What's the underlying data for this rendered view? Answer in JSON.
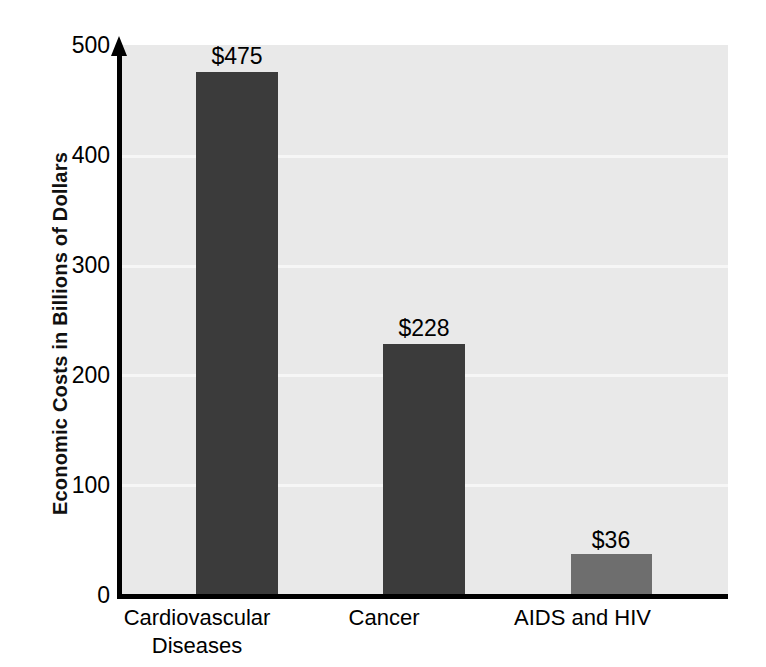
{
  "chart_data": {
    "type": "bar",
    "title": "",
    "subtitle": "",
    "xlabel": "",
    "ylabel": "Economic Costs in Billions of Dollars",
    "categories": [
      "Cardiovascular Diseases",
      "Cancer",
      "AIDS and HIV"
    ],
    "category_display": [
      "Cardiovascular\nDiseases",
      "Cancer",
      "AIDS and HIV"
    ],
    "values": [
      475,
      228,
      36
    ],
    "data_labels": [
      "$475",
      "$228",
      "$36"
    ],
    "bar_colors": [
      "#3b3b3b",
      "#3b3b3b",
      "#6e6e6e"
    ],
    "ylim": [
      0,
      500
    ],
    "yticks": [
      500,
      400,
      300,
      200,
      100,
      0
    ],
    "ytick_labels": [
      "500",
      "400",
      "300",
      "200",
      "100",
      "0"
    ],
    "gridlines": [
      400,
      300,
      200,
      100
    ],
    "grid": true,
    "grid_color": "#f6f6f6",
    "plot_background": "#e9e9e9",
    "figure_background": "#ffffff",
    "axis_color": "#000000",
    "legend": null,
    "legend_position": "none"
  }
}
